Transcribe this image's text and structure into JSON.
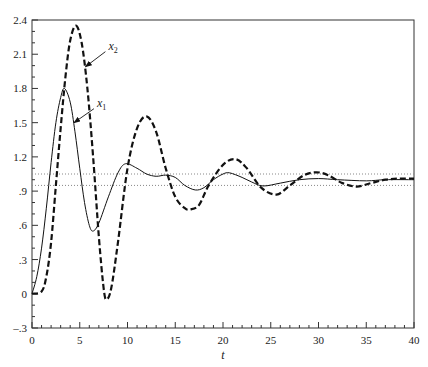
{
  "chart_data": {
    "type": "line",
    "title": "",
    "xlabel": "t",
    "ylabel": "",
    "xlim": [
      0,
      40
    ],
    "ylim": [
      -0.3,
      2.4
    ],
    "grid": false,
    "legend": "none (inline arrow annotations)",
    "x_ticks": [
      0,
      5,
      10,
      15,
      20,
      25,
      30,
      35,
      40
    ],
    "x_tick_labels": [
      "0",
      "5",
      "10",
      "15",
      "20",
      "25",
      "30",
      "35",
      "40"
    ],
    "y_ticks": [
      -0.3,
      0,
      0.3,
      0.6,
      0.9,
      1.2,
      1.5,
      1.8,
      2.1,
      2.4
    ],
    "y_tick_labels": [
      "-.3",
      "0",
      ".3",
      ".6",
      ".9",
      "1.2",
      "1.5",
      "1.8",
      "2.1",
      "2.4"
    ],
    "reference_lines": [
      {
        "y": 1.05,
        "style": "dotted"
      },
      {
        "y": 0.95,
        "style": "dotted"
      }
    ],
    "series": [
      {
        "name": "x1",
        "label": "x",
        "subscript": "1",
        "style": "solid",
        "points": [
          [
            0,
            0
          ],
          [
            0.5,
            0.15
          ],
          [
            1,
            0.4
          ],
          [
            1.5,
            0.75
          ],
          [
            2,
            1.15
          ],
          [
            2.5,
            1.5
          ],
          [
            3,
            1.72
          ],
          [
            3.4,
            1.8
          ],
          [
            4,
            1.68
          ],
          [
            4.5,
            1.42
          ],
          [
            5,
            1.1
          ],
          [
            5.5,
            0.8
          ],
          [
            6,
            0.6
          ],
          [
            6.4,
            0.55
          ],
          [
            7,
            0.62
          ],
          [
            8,
            0.85
          ],
          [
            9,
            1.06
          ],
          [
            9.8,
            1.14
          ],
          [
            11,
            1.1
          ],
          [
            12,
            1.05
          ],
          [
            13,
            1.03
          ],
          [
            14,
            1.04
          ],
          [
            15,
            1.02
          ],
          [
            16,
            0.95
          ],
          [
            17.1,
            0.91
          ],
          [
            18,
            0.93
          ],
          [
            19,
            1.0
          ],
          [
            20,
            1.05
          ],
          [
            20.7,
            1.06
          ],
          [
            22,
            1.02
          ],
          [
            23,
            0.98
          ],
          [
            24.2,
            0.945
          ],
          [
            26,
            0.97
          ],
          [
            28,
            1.0
          ],
          [
            30,
            1.01
          ],
          [
            32,
            1.0
          ],
          [
            35,
            0.99
          ],
          [
            37,
            1.0
          ],
          [
            40,
            1.0
          ]
        ]
      },
      {
        "name": "x2",
        "label": "x",
        "subscript": "2",
        "style": "dashed",
        "points": [
          [
            0,
            0
          ],
          [
            1,
            0.02
          ],
          [
            1.5,
            0.15
          ],
          [
            2,
            0.45
          ],
          [
            2.5,
            0.95
          ],
          [
            3,
            1.45
          ],
          [
            3.5,
            1.9
          ],
          [
            4,
            2.22
          ],
          [
            4.6,
            2.35
          ],
          [
            5.2,
            2.2
          ],
          [
            5.8,
            1.8
          ],
          [
            6.4,
            1.2
          ],
          [
            7,
            0.5
          ],
          [
            7.5,
            0.05
          ],
          [
            7.8,
            -0.05
          ],
          [
            8.3,
            0.05
          ],
          [
            9,
            0.45
          ],
          [
            10,
            1.1
          ],
          [
            11,
            1.45
          ],
          [
            12,
            1.555
          ],
          [
            13,
            1.42
          ],
          [
            14,
            1.1
          ],
          [
            15,
            0.85
          ],
          [
            16,
            0.75
          ],
          [
            16.6,
            0.74
          ],
          [
            17.5,
            0.78
          ],
          [
            18.5,
            0.95
          ],
          [
            20,
            1.13
          ],
          [
            21.3,
            1.18
          ],
          [
            22.5,
            1.1
          ],
          [
            24,
            0.93
          ],
          [
            25.6,
            0.87
          ],
          [
            27,
            0.95
          ],
          [
            28.5,
            1.04
          ],
          [
            29.8,
            1.065
          ],
          [
            31,
            1.04
          ],
          [
            32.5,
            0.97
          ],
          [
            34,
            0.94
          ],
          [
            35.5,
            0.97
          ],
          [
            37,
            1.0
          ],
          [
            38.5,
            1.01
          ],
          [
            40,
            1.01
          ]
        ]
      }
    ],
    "annotations": [
      {
        "text": "x2",
        "series": "x2",
        "label_at": [
          8.0,
          2.14
        ],
        "arrow_to": [
          5.6,
          1.99
        ]
      },
      {
        "text": "x1",
        "series": "x1",
        "label_at": [
          6.8,
          1.64
        ],
        "arrow_to": [
          4.4,
          1.5
        ]
      }
    ]
  }
}
